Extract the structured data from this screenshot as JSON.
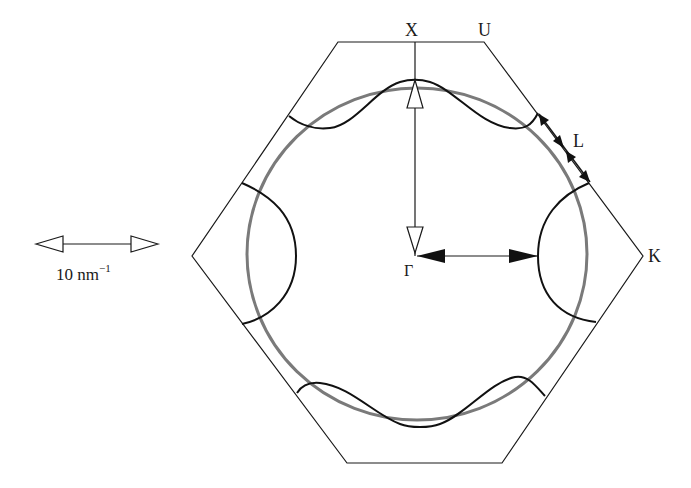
{
  "figure": {
    "type": "brillouin-zone-fermi-surface",
    "colors": {
      "zone_boundary": "#1a1a1a",
      "fermi_surface": "#111111",
      "free_electron_sphere": "#7a7a7a",
      "background": "#ffffff"
    }
  },
  "labels": {
    "X": "X",
    "U": "U",
    "L": "L",
    "K": "K",
    "Gamma": "Γ"
  },
  "scale_bar": {
    "label_value": "10 nm",
    "label_exponent": "−1"
  },
  "arrows": [
    {
      "name": "gamma-to-X",
      "style": "open-head",
      "from": "Γ",
      "to": "X"
    },
    {
      "name": "gamma-to-fermi-surface-K",
      "style": "filled-head",
      "from": "Γ",
      "to": "Fermi surface along Γ–K"
    },
    {
      "name": "neck-at-L",
      "style": "filled-head double",
      "location": "L"
    }
  ]
}
